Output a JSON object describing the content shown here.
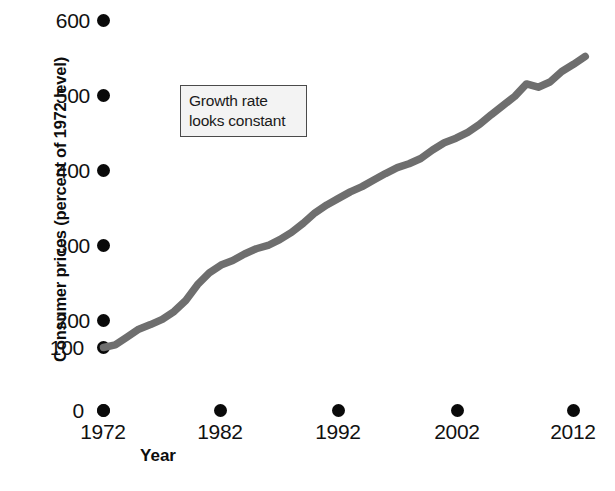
{
  "chart_data": {
    "type": "line",
    "title": "",
    "xlabel": "Year",
    "ylabel": "Consumer prices (percent of 1972 level)",
    "xlim": [
      1972,
      2013
    ],
    "ylim": [
      0,
      620
    ],
    "xticks": [
      "1972",
      "1982",
      "1992",
      "2002",
      "2012"
    ],
    "yticks": [
      "0",
      "100",
      "200",
      "300",
      "400",
      "500",
      "600"
    ],
    "grid": false,
    "legend": "none",
    "line_color": "#6e6e6e",
    "series": [
      {
        "name": "Consumer price index (1972 = 100)",
        "x": [
          1972,
          1973,
          1974,
          1975,
          1976,
          1977,
          1978,
          1979,
          1980,
          1981,
          1982,
          1983,
          1984,
          1985,
          1986,
          1987,
          1988,
          1989,
          1990,
          1991,
          1992,
          1993,
          1994,
          1995,
          1996,
          1997,
          1998,
          1999,
          2000,
          2001,
          2002,
          2003,
          2004,
          2005,
          2006,
          2007,
          2008,
          2009,
          2010,
          2011,
          2012,
          2013
        ],
        "values": [
          100,
          104,
          116,
          128,
          135,
          143,
          155,
          172,
          196,
          214,
          226,
          233,
          243,
          251,
          256,
          265,
          276,
          290,
          306,
          318,
          328,
          338,
          346,
          356,
          366,
          375,
          381,
          389,
          402,
          413,
          420,
          429,
          441,
          456,
          470,
          484,
          503,
          498,
          506,
          522,
          533,
          545
        ]
      }
    ],
    "annotations": [
      {
        "name": "growth-rate-callout",
        "lines": [
          "Growth rate",
          "looks constant"
        ],
        "border_color": "#4a4a4a",
        "fill_color": "#f3f3f3"
      }
    ]
  },
  "axes": {
    "y_title": "Consumer prices (percent of 1972 level)",
    "x_title": "Year",
    "y_tick_labels": [
      "600",
      "500",
      "400",
      "300",
      "200",
      "100",
      "0"
    ],
    "x_tick_labels": [
      "1972",
      "1982",
      "1992",
      "2002",
      "2012"
    ]
  },
  "annotation": {
    "line1": "Growth rate",
    "line2": "looks constant"
  }
}
